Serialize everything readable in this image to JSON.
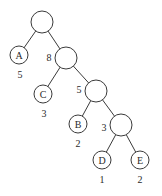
{
  "diagram": {
    "type": "huffman-tree",
    "nodes": [
      {
        "id": "root",
        "label": "",
        "weight": ""
      },
      {
        "id": "A",
        "label": "A",
        "weight": "5"
      },
      {
        "id": "n8",
        "label": "",
        "weight": "8"
      },
      {
        "id": "C",
        "label": "C",
        "weight": "3"
      },
      {
        "id": "n5",
        "label": "",
        "weight": "5"
      },
      {
        "id": "B",
        "label": "B",
        "weight": "2"
      },
      {
        "id": "n3",
        "label": "",
        "weight": "3"
      },
      {
        "id": "D",
        "label": "D",
        "weight": "1"
      },
      {
        "id": "E",
        "label": "E",
        "weight": "2"
      }
    ],
    "edges": [
      [
        "root",
        "A"
      ],
      [
        "root",
        "n8"
      ],
      [
        "n8",
        "C"
      ],
      [
        "n8",
        "n5"
      ],
      [
        "n5",
        "B"
      ],
      [
        "n5",
        "n3"
      ],
      [
        "n3",
        "D"
      ],
      [
        "n3",
        "E"
      ]
    ]
  },
  "colors": {
    "line": "#3a3a3a",
    "text": "#2a2a2a",
    "background": "#ffffff"
  }
}
